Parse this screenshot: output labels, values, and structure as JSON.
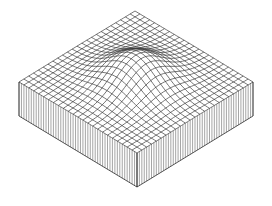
{
  "figure": {
    "title": "",
    "surface": {
      "function": "gaussian",
      "grid_cells": 24,
      "peak_height_relative": 0.45,
      "peak_center": [
        0.5,
        0.5
      ],
      "sigma_relative": 0.17
    },
    "slab": {
      "wall_lines_per_cell": 2
    },
    "colors": {
      "line": "#3a3a3a",
      "wall": "#6a6a6a",
      "background": "#ffffff"
    }
  }
}
